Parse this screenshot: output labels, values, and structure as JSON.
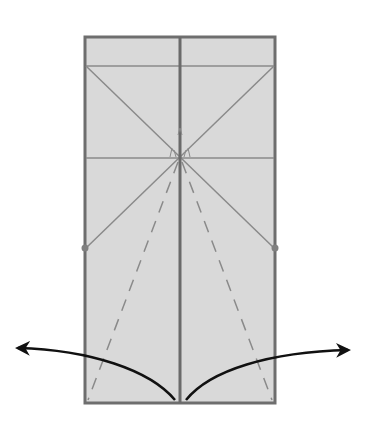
{
  "diagram": {
    "type": "origami-fold-instruction",
    "colors": {
      "background": "#ffffff",
      "paper": "#d9d9d9",
      "edge": "#6e6e6e",
      "crease": "#8a8a8a",
      "center_line": "#6a6a6a",
      "arrow": "#111111",
      "dot": "#808080"
    },
    "paper": {
      "x": 85,
      "y": 37,
      "width": 190,
      "height": 366
    },
    "center_line_x": 180,
    "horizontal_creases_y": [
      66,
      158
    ],
    "diagonal_intersection": {
      "x": 180,
      "y": 158
    },
    "reference_points": [
      {
        "x": 85,
        "y": 248
      },
      {
        "x": 275,
        "y": 248
      }
    ],
    "dashed_valley_folds": [
      {
        "from": {
          "x": 178,
          "y": 160
        },
        "to": {
          "x": 88,
          "y": 400
        }
      },
      {
        "from": {
          "x": 182,
          "y": 160
        },
        "to": {
          "x": 272,
          "y": 400
        }
      }
    ],
    "arrows": [
      {
        "direction": "left",
        "label": "unfold-left"
      },
      {
        "direction": "right",
        "label": "unfold-right"
      }
    ]
  }
}
